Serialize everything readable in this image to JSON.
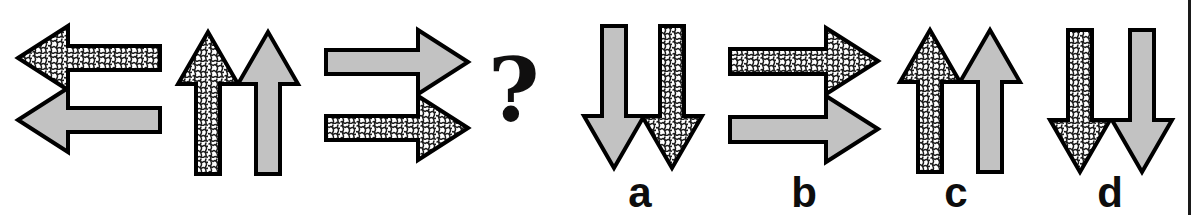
{
  "page": {
    "kind": "visual-analogy-puzzle",
    "width": 1199,
    "height": 215,
    "background": "#ffffff"
  },
  "colors": {
    "stroke": "#000000",
    "gray_fill": "#c2c2c2",
    "texture_fill": "#ffffff",
    "texture_stroke": "#1d1d1d",
    "label_color": "#0d0d0d",
    "question_color": "#100f0f",
    "edge_rule": "#1a1a1a"
  },
  "prompt": {
    "name": "analogy-prompt",
    "question_glyph": "?",
    "groups": [
      {
        "id": "prompt-group-1",
        "name": "left-arrow-pair",
        "direction": "left",
        "layout": "stacked-vertical",
        "arrows": [
          {
            "id": "p1-a1",
            "direction": "left",
            "fill": "texture",
            "position": "top"
          },
          {
            "id": "p1-a2",
            "direction": "left",
            "fill": "gray",
            "position": "bottom"
          }
        ]
      },
      {
        "id": "prompt-group-2",
        "name": "up-arrow-pair",
        "direction": "up",
        "layout": "side-by-side-horizontal",
        "arrows": [
          {
            "id": "p2-a1",
            "direction": "up",
            "fill": "texture",
            "position": "left"
          },
          {
            "id": "p2-a2",
            "direction": "up",
            "fill": "gray",
            "position": "right"
          }
        ]
      },
      {
        "id": "prompt-group-3",
        "name": "right-arrow-pair",
        "direction": "right",
        "layout": "stacked-vertical",
        "arrows": [
          {
            "id": "p3-a1",
            "direction": "right",
            "fill": "gray",
            "position": "top"
          },
          {
            "id": "p3-a2",
            "direction": "right",
            "fill": "texture",
            "position": "bottom"
          }
        ]
      }
    ]
  },
  "options": [
    {
      "id": "option-a",
      "label": "a",
      "direction": "down",
      "layout": "side-by-side-horizontal",
      "arrows": [
        {
          "id": "a-a1",
          "direction": "down",
          "fill": "gray",
          "position": "left"
        },
        {
          "id": "a-a2",
          "direction": "down",
          "fill": "texture",
          "position": "right"
        }
      ]
    },
    {
      "id": "option-b",
      "label": "b",
      "direction": "right",
      "layout": "stacked-vertical",
      "arrows": [
        {
          "id": "b-a1",
          "direction": "right",
          "fill": "texture",
          "position": "top"
        },
        {
          "id": "b-a2",
          "direction": "right",
          "fill": "gray",
          "position": "bottom"
        }
      ]
    },
    {
      "id": "option-c",
      "label": "c",
      "direction": "up",
      "layout": "side-by-side-horizontal",
      "arrows": [
        {
          "id": "c-a1",
          "direction": "up",
          "fill": "texture",
          "position": "left"
        },
        {
          "id": "c-a2",
          "direction": "up",
          "fill": "gray",
          "position": "right"
        }
      ]
    },
    {
      "id": "option-d",
      "label": "d",
      "direction": "down",
      "layout": "side-by-side-horizontal",
      "arrows": [
        {
          "id": "d-a1",
          "direction": "down",
          "fill": "texture",
          "position": "left"
        },
        {
          "id": "d-a2",
          "direction": "down",
          "fill": "gray",
          "position": "right"
        }
      ]
    }
  ],
  "labels": {
    "a": "a",
    "b": "b",
    "c": "c",
    "d": "d"
  }
}
